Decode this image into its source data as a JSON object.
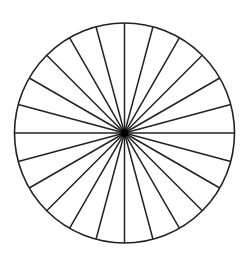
{
  "diagram": {
    "type": "divided-circle",
    "sectors": 24,
    "sector_angle_deg": 15,
    "center": [
      124.5,
      133
    ],
    "radius": 110,
    "stroke_color": "#222222",
    "background": "#ffffff"
  }
}
